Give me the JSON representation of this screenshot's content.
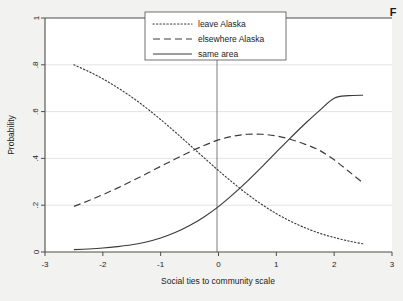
{
  "figure": {
    "caption_fragment": "F",
    "background_color": "#f2f2f0",
    "plot_background_color": "#ffffff",
    "line_color": "#3a3a3a",
    "grid_color": "#d9d9d9"
  },
  "chart_data": {
    "type": "line",
    "title": "",
    "subtitle": "",
    "xlabel": "Social ties to community scale",
    "ylabel": "Probability",
    "xlim": [
      -3,
      3
    ],
    "ylim": [
      0,
      1
    ],
    "xticks": [
      "-3",
      "-2",
      "-1",
      "0",
      "1",
      "2",
      "3"
    ],
    "xtick_values": [
      -3,
      -2,
      -1,
      0,
      1,
      2,
      3
    ],
    "yticks": [
      "0",
      ".2",
      ".4",
      ".6",
      ".8",
      "1"
    ],
    "ytick_values": [
      0,
      0.2,
      0.4,
      0.6,
      0.8,
      1
    ],
    "grid": "horizontal",
    "reference_line_x": 0,
    "legend_position": "top-center",
    "x": [
      -2.5,
      -2.25,
      -2,
      -1.75,
      -1.5,
      -1.25,
      -1,
      -0.75,
      -0.5,
      -0.25,
      0,
      0.25,
      0.5,
      0.75,
      1,
      1.25,
      1.5,
      1.75,
      2,
      2.25,
      2.5
    ],
    "series": [
      {
        "name": "leave Alaska",
        "style": "dotted",
        "values": [
          0.8,
          0.772,
          0.74,
          0.703,
          0.662,
          0.616,
          0.566,
          0.513,
          0.458,
          0.403,
          0.348,
          0.296,
          0.247,
          0.203,
          0.164,
          0.131,
          0.103,
          0.08,
          0.062,
          0.047,
          0.035
        ]
      },
      {
        "name": "elsewhere Alaska",
        "style": "dashed",
        "values": [
          0.195,
          0.219,
          0.245,
          0.273,
          0.303,
          0.334,
          0.366,
          0.397,
          0.427,
          0.455,
          0.479,
          0.495,
          0.503,
          0.503,
          0.496,
          0.481,
          0.46,
          0.434,
          0.394,
          0.345,
          0.295
        ]
      },
      {
        "name": "same area",
        "style": "solid",
        "values": [
          0.01,
          0.013,
          0.017,
          0.023,
          0.031,
          0.043,
          0.06,
          0.083,
          0.113,
          0.15,
          0.194,
          0.246,
          0.303,
          0.364,
          0.427,
          0.489,
          0.549,
          0.605,
          0.657,
          0.668,
          0.67
        ]
      }
    ]
  },
  "legend": {
    "entries": [
      {
        "label": "leave Alaska",
        "style": "dotted"
      },
      {
        "label": "elsewhere Alaska",
        "style": "dashed"
      },
      {
        "label": "same area",
        "style": "solid"
      }
    ]
  }
}
